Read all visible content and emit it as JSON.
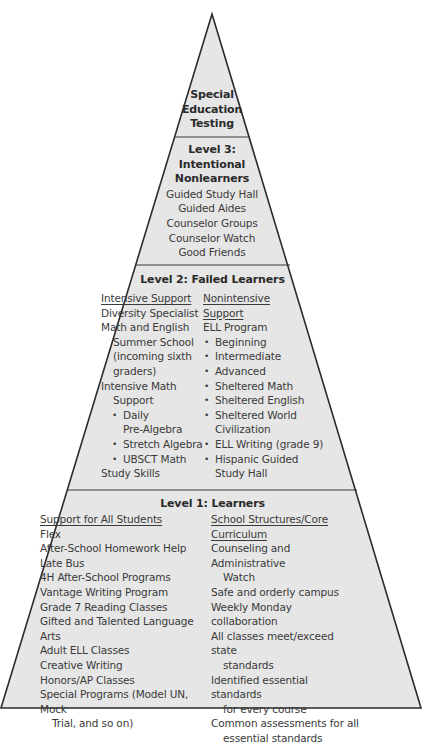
{
  "diagram": {
    "type": "pyramid",
    "fill_color": "#e6e6e6",
    "stroke_color": "#2b2b2b",
    "tiers": [
      {
        "id": "top",
        "title_lines": [
          "Special",
          "Education",
          "Testing"
        ],
        "items": []
      },
      {
        "id": "level3",
        "title_lines": [
          "Level 3:",
          "Intentional",
          "Nonlearners"
        ],
        "items": [
          "Guided Study Hall",
          "Guided Aides",
          "Counselor Groups",
          "Counselor Watch",
          "Good Friends"
        ]
      },
      {
        "id": "level2",
        "title": "Level 2: Failed Learners",
        "left_column": {
          "header": "Intensive Support",
          "lines": [
            "Diversity Specialist",
            "Math and English",
            "Summer School",
            "(incoming sixth",
            "graders)",
            "Intensive Math",
            "Support",
            "Daily",
            "Pre-Algebra",
            "Stretch Algebra",
            "UBSCT Math",
            "Study Skills"
          ]
        },
        "right_column": {
          "header_lines": [
            "Nonintensive",
            "Support"
          ],
          "lines": [
            "ELL Program",
            "Beginning",
            "Intermediate",
            "Advanced",
            "Sheltered Math",
            "Sheltered English",
            "Sheltered World",
            "Civilization",
            "ELL Writing (grade 9)",
            "Hispanic Guided",
            "Study Hall"
          ]
        }
      },
      {
        "id": "level1",
        "title": "Level 1: Learners",
        "left_column": {
          "header": "Support for All Students",
          "lines": [
            "Flex",
            "After-School Homework Help",
            "Late Bus",
            "4H After-School Programs",
            "Vantage Writing Program",
            "Grade 7 Reading Classes",
            "Gifted and Talented Language Arts",
            "Adult ELL Classes",
            "Creative Writing",
            "Honors/AP Classes",
            "Special Programs (Model UN, Mock",
            "Trial, and so on)"
          ]
        },
        "right_column": {
          "header_lines": [
            "School Structures/Core",
            "Curriculum"
          ],
          "lines": [
            "Counseling and Administrative",
            "Watch",
            "Safe and orderly campus",
            "Weekly Monday collaboration",
            "All classes meet/exceed state",
            "standards",
            "Identified essential standards",
            "for every course",
            "Common assessments for all",
            "essential standards"
          ]
        }
      }
    ]
  }
}
